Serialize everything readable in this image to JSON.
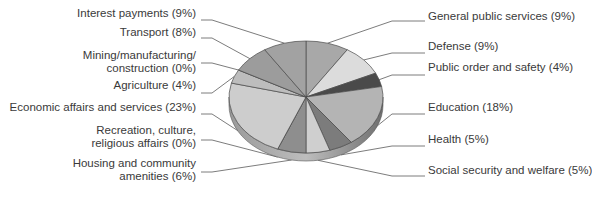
{
  "chart_data": {
    "type": "pie",
    "style": "3d-tilted",
    "title": "",
    "start_angle": "12 o'clock, clockwise",
    "slices": [
      {
        "label": "General public services",
        "value": 9,
        "color": "#a8a8a8",
        "side": "right"
      },
      {
        "label": "Defense",
        "value": 9,
        "color": "#dcdcdc",
        "side": "right"
      },
      {
        "label": "Public order and safety",
        "value": 4,
        "color": "#4a4a4a",
        "side": "right"
      },
      {
        "label": "Education",
        "value": 18,
        "color": "#b4b4b4",
        "side": "right"
      },
      {
        "label": "Health",
        "value": 5,
        "color": "#7c7c7c",
        "side": "right"
      },
      {
        "label": "Social security and welfare",
        "value": 5,
        "color": "#cfcfcf",
        "side": "right"
      },
      {
        "label": "Housing and community amenities",
        "value": 6,
        "color": "#8e8e8e",
        "side": "left"
      },
      {
        "label": "Recreation, culture, religious affairs",
        "value": 0,
        "color": "#9a9a9a",
        "side": "left"
      },
      {
        "label": "Economic affairs and services",
        "value": 23,
        "color": "#cdcdcd",
        "side": "left"
      },
      {
        "label": "Agriculture",
        "value": 4,
        "color": "#bdbdbd",
        "side": "left"
      },
      {
        "label": "Mining/manufacturing/construction",
        "value": 0,
        "color": "#8a8a8a",
        "side": "left"
      },
      {
        "label": "Transport",
        "value": 8,
        "color": "#9c9c9c",
        "side": "left"
      },
      {
        "label": "Interest payments",
        "value": 9,
        "color": "#a2a2a2",
        "side": "left"
      }
    ],
    "legend": "none (callout labels with leader lines)",
    "units": "%"
  },
  "labels": {
    "left": [
      {
        "lines": [
          "Interest payments (9%)"
        ],
        "y": 14
      },
      {
        "lines": [
          "Transport (8%)"
        ],
        "y": 33
      },
      {
        "lines": [
          "Mining/manufacturing/",
          "construction (0%)"
        ],
        "y": 56
      },
      {
        "lines": [
          "Agriculture (4%)"
        ],
        "y": 86
      },
      {
        "lines": [
          "Economic affairs and services (23%)"
        ],
        "y": 108
      },
      {
        "lines": [
          "Recreation, culture,",
          "religious affairs (0%)"
        ],
        "y": 131
      },
      {
        "lines": [
          "Housing and community",
          "amenities (6%)"
        ],
        "y": 164
      }
    ],
    "right": [
      {
        "lines": [
          "General public services (9%)"
        ],
        "y": 17
      },
      {
        "lines": [
          "Defense (9%)"
        ],
        "y": 47
      },
      {
        "lines": [
          "Public order and safety (4%)"
        ],
        "y": 68
      },
      {
        "lines": [
          "Education (18%)"
        ],
        "y": 108
      },
      {
        "lines": [
          "Health (5%)"
        ],
        "y": 140
      },
      {
        "lines": [
          "Social security and welfare (5%)"
        ],
        "y": 171
      }
    ]
  }
}
